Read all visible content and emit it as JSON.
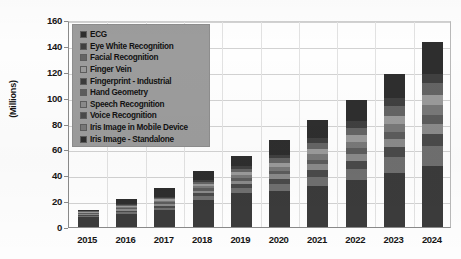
{
  "chart_data": {
    "type": "bar",
    "stacked": true,
    "title": "",
    "xlabel": "",
    "ylabel": "(Millions)",
    "ylim": [
      0,
      160
    ],
    "ytick_step": 20,
    "yticks": [
      "0",
      "20",
      "40",
      "60",
      "80",
      "100",
      "120",
      "140",
      "160"
    ],
    "grid": true,
    "legend_position": "top-left-inside",
    "categories": [
      "2015",
      "2016",
      "2017",
      "2018",
      "2019",
      "2020",
      "2021",
      "2022",
      "2023",
      "2024"
    ],
    "totals": [
      13,
      22,
      30,
      43,
      55,
      67,
      83,
      98,
      118,
      143
    ],
    "series": [
      {
        "name": "Iris Image - Standalone",
        "color": "#3b3b3b",
        "values": [
          7.5,
          10.0,
          13.0,
          21.0,
          26.0,
          28.0,
          32.0,
          36.0,
          42.0,
          47.0
        ]
      },
      {
        "name": "Iris Image in Mobile Device",
        "color": "#6f6f6f",
        "values": [
          1.0,
          1.4,
          2.0,
          3.0,
          4.0,
          5.5,
          7.0,
          9.0,
          12.0,
          16.0
        ]
      },
      {
        "name": "Voice Recognition",
        "color": "#4a4a4a",
        "values": [
          0.8,
          1.2,
          1.6,
          2.2,
          3.0,
          3.8,
          5.0,
          6.0,
          7.5,
          9.0
        ]
      },
      {
        "name": "Speech Recognition",
        "color": "#8a8a8a",
        "values": [
          0.7,
          1.0,
          1.4,
          2.0,
          2.6,
          3.4,
          4.4,
          5.4,
          6.6,
          8.0
        ]
      },
      {
        "name": "Hand Geometry",
        "color": "#5c5c5c",
        "values": [
          0.6,
          0.9,
          1.2,
          1.7,
          2.2,
          2.9,
          3.7,
          4.5,
          5.5,
          6.7
        ]
      },
      {
        "name": "Fingerprint - Industrial",
        "color": "#787878",
        "values": [
          0.6,
          0.9,
          1.2,
          1.8,
          2.4,
          3.2,
          4.2,
          5.2,
          6.4,
          7.8
        ]
      },
      {
        "name": "Finger Vein",
        "color": "#9a9a9a",
        "values": [
          0.5,
          0.8,
          1.1,
          1.6,
          2.2,
          3.0,
          4.0,
          5.0,
          6.2,
          7.6
        ]
      },
      {
        "name": "Facial Recognition",
        "color": "#646464",
        "values": [
          0.5,
          0.8,
          1.2,
          1.8,
          2.5,
          3.4,
          4.6,
          5.8,
          7.2,
          8.9
        ]
      },
      {
        "name": "Eye White Recognition",
        "color": "#404040",
        "values": [
          0.4,
          0.6,
          0.9,
          1.4,
          2.0,
          2.8,
          3.8,
          4.8,
          6.0,
          7.4
        ]
      },
      {
        "name": "ECG",
        "color": "#2e2e2e",
        "values": [
          0.4,
          4.4,
          6.4,
          6.5,
          8.1,
          11.0,
          14.3,
          16.3,
          18.6,
          24.6
        ]
      }
    ]
  },
  "legend": {
    "items": [
      {
        "label": "ECG",
        "color": "#2e2e2e"
      },
      {
        "label": "Eye White Recognition",
        "color": "#404040"
      },
      {
        "label": "Facial Recognition",
        "color": "#646464"
      },
      {
        "label": "Finger Vein",
        "color": "#9a9a9a"
      },
      {
        "label": "Fingerprint - Industrial",
        "color": "#3b3b3b"
      },
      {
        "label": "Hand Geometry",
        "color": "#5c5c5c"
      },
      {
        "label": "Speech Recognition",
        "color": "#8a8a8a"
      },
      {
        "label": "Voice Recognition",
        "color": "#4a4a4a"
      },
      {
        "label": "Iris Image in Mobile Device",
        "color": "#787878"
      },
      {
        "label": "Iris Image - Standalone",
        "color": "#2e2e2e"
      }
    ]
  },
  "axis": {
    "y_title": "(Millions)"
  }
}
